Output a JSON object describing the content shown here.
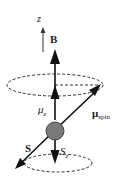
{
  "diagram": {
    "labels": {
      "z_axis": "z",
      "field": "B",
      "mu_z": "μ",
      "mu_z_sub": "z",
      "mu_spin": "μ",
      "mu_spin_sub": "spin",
      "spin": "S",
      "s_z": "S",
      "s_z_sub": "z"
    },
    "colors": {
      "arrow": "#111111",
      "particle_fill": "#7a7a7a",
      "particle_stroke": "#444444",
      "dashed": "#333333"
    }
  }
}
